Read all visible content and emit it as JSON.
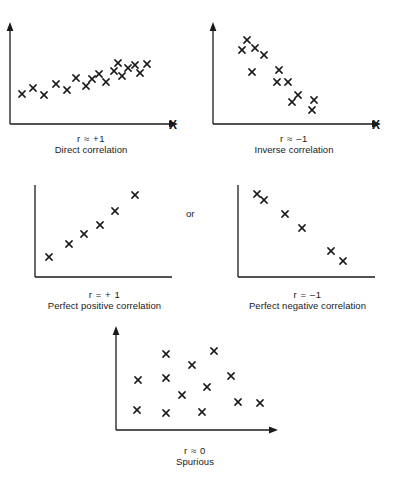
{
  "figure": {
    "background_color": "#ffffff",
    "ink_color": "#1a1a1a",
    "marker_glyph": "x",
    "or_label": "or",
    "axis_letter_x": "X"
  },
  "panels": [
    {
      "id": "direct-correlation",
      "r_label": "r ≈ +1",
      "name_label": "Direct correlation",
      "has_arrowheads": true,
      "has_x_axis_letter": true,
      "axis": {
        "x0": 10,
        "y0": 118,
        "x1": 172,
        "y1": 22
      },
      "points": [
        [
          22,
          88
        ],
        [
          33,
          82
        ],
        [
          44,
          89
        ],
        [
          56,
          78
        ],
        [
          67,
          84
        ],
        [
          76,
          72
        ],
        [
          86,
          80
        ],
        [
          92,
          73
        ],
        [
          99,
          68
        ],
        [
          106,
          76
        ],
        [
          114,
          65
        ],
        [
          122,
          70
        ],
        [
          128,
          62
        ],
        [
          135,
          59
        ],
        [
          140,
          67
        ],
        [
          147,
          58
        ],
        [
          118,
          57
        ]
      ]
    },
    {
      "id": "inverse-correlation",
      "r_label": "r ≈ –1",
      "name_label": "Inverse correlation",
      "has_arrowheads": true,
      "has_x_axis_letter": true,
      "axis": {
        "x0": 10,
        "y0": 118,
        "x1": 172,
        "y1": 22
      },
      "points": [
        [
          44,
          34
        ],
        [
          39,
          44
        ],
        [
          52,
          42
        ],
        [
          61,
          49
        ],
        [
          49,
          66
        ],
        [
          76,
          64
        ],
        [
          74,
          76
        ],
        [
          85,
          76
        ],
        [
          95,
          89
        ],
        [
          89,
          96
        ],
        [
          111,
          94
        ],
        [
          109,
          104
        ]
      ]
    },
    {
      "id": "perfect-positive-correlation",
      "r_label": "r = + 1",
      "name_label": "Perfect positive correlation",
      "has_arrowheads": false,
      "has_x_axis_letter": false,
      "axis": {
        "x0": 13,
        "y0": 115,
        "x1": 150,
        "y1": 23
      },
      "points": [
        [
          27,
          95
        ],
        [
          47,
          82
        ],
        [
          62,
          72
        ],
        [
          78,
          63
        ],
        [
          93,
          49
        ],
        [
          113,
          33
        ]
      ]
    },
    {
      "id": "perfect-negative-correlation",
      "r_label": "r = –1",
      "name_label": "Perfect negative correlation",
      "has_arrowheads": false,
      "has_x_axis_letter": false,
      "axis": {
        "x0": 13,
        "y0": 115,
        "x1": 150,
        "y1": 23
      },
      "points": [
        [
          32,
          32
        ],
        [
          39,
          38
        ],
        [
          60,
          52
        ],
        [
          77,
          66
        ],
        [
          106,
          89
        ],
        [
          118,
          99
        ]
      ]
    },
    {
      "id": "spurious",
      "r_label": "r ≈ 0",
      "name_label": "Spurious",
      "has_arrowheads": true,
      "has_x_axis_letter": false,
      "axis": {
        "x0": 12,
        "y0": 112,
        "x1": 168,
        "y1": 14
      },
      "points": [
        [
          33,
          92
        ],
        [
          34,
          62
        ],
        [
          62,
          95
        ],
        [
          62,
          60
        ],
        [
          62,
          36
        ],
        [
          78,
          77
        ],
        [
          88,
          47
        ],
        [
          98,
          94
        ],
        [
          103,
          69
        ],
        [
          110,
          33
        ],
        [
          127,
          58
        ],
        [
          134,
          84
        ],
        [
          156,
          85
        ]
      ]
    }
  ],
  "layout": {
    "panel_positions": [
      {
        "left": 0,
        "top": 6
      },
      {
        "left": 203,
        "top": 6
      },
      {
        "left": 22,
        "top": 162
      },
      {
        "left": 225,
        "top": 162
      },
      {
        "left": 104,
        "top": 318
      }
    ],
    "or_position": {
      "left": 186,
      "top": 208
    },
    "x_letter_positions": [
      {
        "left": 169,
        "top": 118
      },
      {
        "left": 372,
        "top": 118
      }
    ]
  }
}
